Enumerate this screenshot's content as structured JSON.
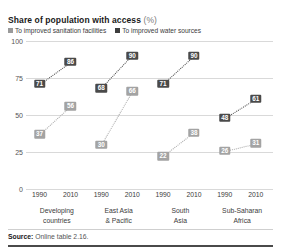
{
  "chart_data": {
    "type": "line",
    "title": "Share of population with access",
    "title_unit": "(%)",
    "xlabel": "",
    "ylabel": "",
    "ylim": [
      0,
      100
    ],
    "yticks": [
      0,
      25,
      50,
      75,
      100
    ],
    "grid": true,
    "legend_position": "top-left",
    "x": [
      "1990",
      "2010"
    ],
    "categories": [
      "Developing countries",
      "East Asia & Pacific",
      "South Asia",
      "Sub-Saharan Africa"
    ],
    "category_lines": [
      [
        "Developing",
        "countries"
      ],
      [
        "East Asia",
        "& Pacific"
      ],
      [
        "South",
        "Asia"
      ],
      [
        "Sub-Saharan",
        "Africa"
      ]
    ],
    "series": [
      {
        "name": "To improved sanitation facilities",
        "color": "#9a9a9a",
        "values": [
          [
            37,
            56
          ],
          [
            30,
            66
          ],
          [
            22,
            38
          ],
          [
            26,
            31
          ]
        ]
      },
      {
        "name": "To improved water sources",
        "color": "#3d3d3d",
        "values": [
          [
            71,
            86
          ],
          [
            68,
            90
          ],
          [
            71,
            90
          ],
          [
            48,
            61
          ]
        ]
      }
    ],
    "annotations": []
  },
  "footer": {
    "source_label": "Source:",
    "source_text": "Online table 2.16."
  }
}
